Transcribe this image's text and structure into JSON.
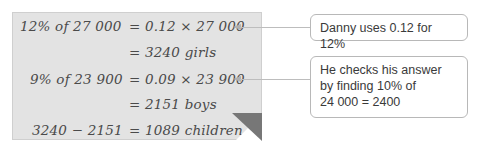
{
  "note": {
    "rows": [
      {
        "left": "12% of 27 000",
        "right": "= 0.12 × 27 000"
      },
      {
        "left": "",
        "right": "= 3240 girls"
      },
      {
        "left": "9% of 23 900",
        "right": "= 0.09 × 23 900"
      },
      {
        "left": "",
        "right": "= 2151 boys"
      },
      {
        "left": "3240 − 2151",
        "right": "= 1089 children"
      }
    ]
  },
  "callouts": [
    {
      "text": "Danny uses 0.12 for 12%"
    },
    {
      "lines": [
        "He checks his answer",
        "by finding 10% of",
        "24 000 = 2400"
      ]
    }
  ]
}
